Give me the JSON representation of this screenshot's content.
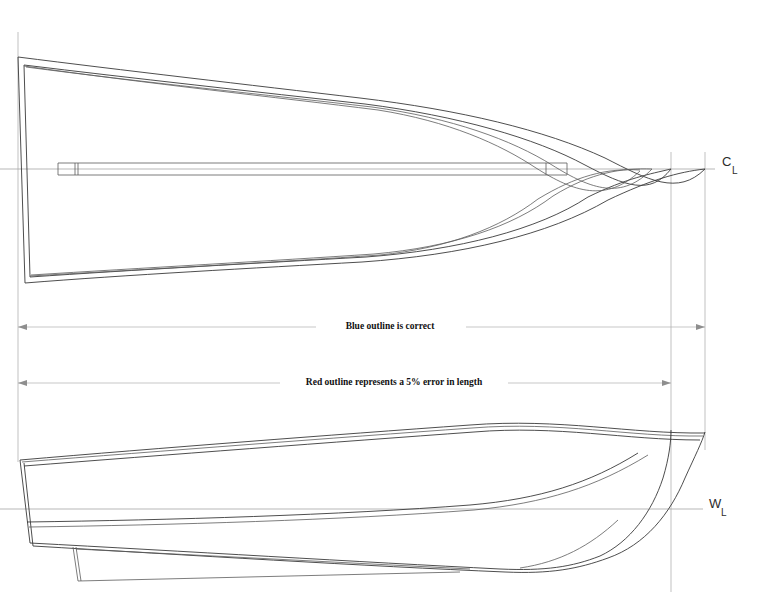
{
  "drawing": {
    "title": "Boat hull lines comparison drawing",
    "background_color": "#ffffff",
    "line_color": "#3a3a3a",
    "reference_line_color": "#9a9a9a",
    "dimension_line_color": "#b0b0b0",
    "annotation_text_color": "#111111",
    "width": 763,
    "height": 610
  },
  "views": {
    "plan": {
      "name": "plan-view",
      "label": "Plan view (half-breadth)",
      "centerline_y": 169
    },
    "profile": {
      "name": "profile-view",
      "label": "Profile view (sheer)",
      "waterline_y": 509
    }
  },
  "axis_labels": [
    {
      "id": "centerline",
      "letter": "C",
      "subscript": "L",
      "x": 726,
      "y": 164,
      "meaning": "Centerline"
    },
    {
      "id": "waterline",
      "letter": "W",
      "subscript": "L",
      "x": 714,
      "y": 506,
      "meaning": "Waterline"
    }
  ],
  "annotations": [
    {
      "id": "blue-outline-note",
      "text": "Blue outline is correct",
      "x": 390,
      "y": 328,
      "dimension_y": 327,
      "dimension_left_x": 18,
      "dimension_right_x": 705
    },
    {
      "id": "red-outline-note",
      "text": "Red outline represents a 5% error in length",
      "x": 393,
      "y": 385,
      "dimension_y": 383,
      "dimension_left_x": 18,
      "dimension_right_x": 671
    }
  ],
  "dimension_lines": [
    {
      "id": "correct-length-dimension",
      "label": "Blue outline is correct",
      "y": 327,
      "x_start": 18,
      "x_end": 705,
      "length_px": 687,
      "arrow_ends": "both"
    },
    {
      "id": "error-length-dimension",
      "label": "Red outline represents a 5% error in length",
      "y": 383,
      "x_start": 18,
      "x_end": 671,
      "length_px": 653,
      "arrow_ends": "both"
    }
  ],
  "reference_lines": [
    {
      "id": "stern-extension-line",
      "x": 18,
      "y1": 32,
      "y2": 462,
      "orientation": "vertical"
    },
    {
      "id": "bow-inner-extension-line",
      "x": 671,
      "y1": 152,
      "y2": 590,
      "orientation": "vertical"
    },
    {
      "id": "bow-outer-extension-line",
      "x": 705,
      "y1": 152,
      "y2": 448,
      "orientation": "vertical"
    },
    {
      "id": "centerline-axis",
      "y": 169,
      "x1": 0,
      "x2": 715,
      "orientation": "horizontal"
    },
    {
      "id": "waterline-axis",
      "y": 509,
      "x1": 0,
      "x2": 705,
      "orientation": "horizontal"
    }
  ],
  "legend_meaning": {
    "correct_outline": "Blue outline is correct",
    "error_outline": "Red outline represents a 5% error in length",
    "error_percent": "5%"
  }
}
